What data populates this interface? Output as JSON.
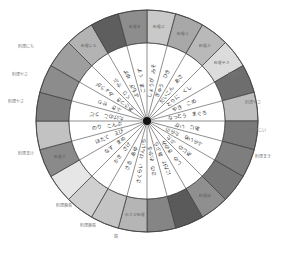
{
  "diagram": {
    "title": "",
    "center": {
      "x": 147,
      "y": 121
    },
    "radii": {
      "outer": 111,
      "inner": 78,
      "hub": 4
    },
    "segment_count": 24,
    "colors": {
      "background": "#ffffff",
      "inner_fill": "#ffffff",
      "border": "#444444",
      "hub": "#111111"
    },
    "segments": [
      {
        "outer_fill": "#c9c9c9",
        "outer_text": "料理ぶ",
        "inner_text": "しょうが　みそ"
      },
      {
        "outer_fill": "#a8a8a8",
        "outer_text": "料理ふ",
        "inner_text": "ぎゅう　ひき"
      },
      {
        "outer_fill": "#b9b9b9",
        "outer_text": "料理ぶ",
        "inner_text": "だいこん　あさ"
      },
      {
        "outer_fill": "#dcdcdc",
        "outer_text": "料理やさ",
        "inner_text": "とりに　くし"
      },
      {
        "outer_fill": "#6e6e6e",
        "outer_text": "",
        "inner_text": "やき　こめ"
      },
      {
        "outer_fill": "#bdbdbd",
        "outer_text": "",
        "inner_text": "なっとう　まぐろ"
      },
      {
        "outer_fill": "#7a7a7a",
        "outer_text": "",
        "inner_text": "あじ　いか"
      },
      {
        "outer_fill": "#7e7e7e",
        "outer_text": "",
        "inner_text": "ふらいめ　たらの"
      },
      {
        "outer_fill": "#777777",
        "outer_text": "",
        "inner_text": "あじの　ぶた"
      },
      {
        "outer_fill": "#8f8f8f",
        "outer_text": "料理ほ",
        "inner_text": "しの　きのみ"
      },
      {
        "outer_fill": "#5a5a5a",
        "outer_text": "",
        "inner_text": "にたけ　あぶら"
      },
      {
        "outer_fill": "#858585",
        "outer_text": "",
        "inner_text": "さの　わかる"
      },
      {
        "outer_fill": "#b5b5b5",
        "outer_text": "わさび料理",
        "inner_text": "さくらい　けんいち"
      },
      {
        "outer_fill": "#c4c4c4",
        "outer_text": "",
        "inner_text": "さる　あゆ"
      },
      {
        "outer_fill": "#d0d0d0",
        "outer_text": "",
        "inner_text": "かき　さけ"
      },
      {
        "outer_fill": "#e6e6e6",
        "outer_text": "",
        "inner_text": "なす　まめ"
      },
      {
        "outer_fill": "#8a8a8a",
        "outer_text": "料理さ",
        "inner_text": "ほたて　えび"
      },
      {
        "outer_fill": "#c2c2c2",
        "outer_text": "",
        "inner_text": "のり　こんぶ"
      },
      {
        "outer_fill": "#7d7d7d",
        "outer_text": "",
        "inner_text": "たけのこ　うど"
      },
      {
        "outer_fill": "#8c8c8c",
        "outer_text": "",
        "inner_text": "ふき　せり"
      },
      {
        "outer_fill": "#9e9e9e",
        "outer_text": "",
        "inner_text": "あさつき　みょうが"
      },
      {
        "outer_fill": "#b3b3b3",
        "outer_text": "料理にち",
        "inner_text": "くり　かぶ"
      },
      {
        "outer_fill": "#5e5e5e",
        "outer_text": "",
        "inner_text": "よもぎ　ゆず"
      },
      {
        "outer_fill": "#8d8d8d",
        "outer_text": "料理ま",
        "inner_text": "ごま　くず"
      }
    ],
    "external_labels": [
      {
        "text": "料理やさ",
        "x": 228,
        "y": 76
      },
      {
        "text": "料理やさ",
        "x": 245,
        "y": 104
      },
      {
        "text": "料理にい",
        "x": 250,
        "y": 132
      },
      {
        "text": "料理まき",
        "x": 255,
        "y": 158
      },
      {
        "text": "料理にち",
        "x": 18,
        "y": 48
      },
      {
        "text": "料理やさ",
        "x": 12,
        "y": 76
      },
      {
        "text": "料理やさ",
        "x": 8,
        "y": 103
      },
      {
        "text": "料理まけ",
        "x": 18,
        "y": 155
      },
      {
        "text": "料理鹿島",
        "x": 56,
        "y": 207
      },
      {
        "text": "料理鹿島",
        "x": 80,
        "y": 227
      },
      {
        "text": "鶏",
        "x": 114,
        "y": 238
      }
    ]
  }
}
